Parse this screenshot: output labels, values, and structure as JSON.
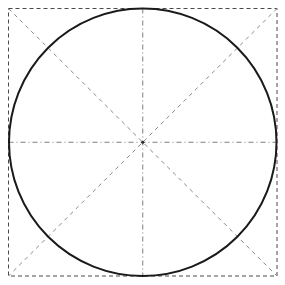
{
  "figure": {
    "type": "geometric-construction",
    "width": 285,
    "height": 285,
    "background_color": "#ffffff"
  },
  "geometry": {
    "square": {
      "name": "bounding-square",
      "left": 8.5,
      "top": 8.5,
      "right": 277.0,
      "bottom": 276.0,
      "width": 268.5,
      "height": 267.5,
      "stroke_color": "#4a4a4a",
      "stroke_width": 1,
      "dash_pattern": "4,3",
      "style": "dashed"
    },
    "circle": {
      "name": "inscribed-circle",
      "center_x": 142.75,
      "center_y": 142.25,
      "radius": 133.75,
      "stroke_color": "#1a1a1a",
      "stroke_width": 2,
      "fill": "none",
      "style": "solid"
    },
    "center_point": {
      "name": "center-point",
      "x": 142.75,
      "y": 142.25,
      "color": "#2a2a2a"
    },
    "radial_lines": [
      {
        "name": "horizontal-axis",
        "angle_deg": 0,
        "x1": 8.5,
        "y1": 142.25,
        "x2": 277.0,
        "y2": 142.25,
        "stroke_color": "#7d7d7d",
        "stroke_width": 1,
        "dash_pattern": "5,3,1,3",
        "style": "dash-dot"
      },
      {
        "name": "vertical-axis",
        "angle_deg": 90,
        "x1": 142.75,
        "y1": 8.5,
        "x2": 142.75,
        "y2": 276.0,
        "stroke_color": "#7d7d7d",
        "stroke_width": 1,
        "dash_pattern": "5,3,1,3",
        "style": "dash-dot"
      },
      {
        "name": "diagonal-nw-se",
        "angle_deg": -45,
        "x1": 8.5,
        "y1": 8.5,
        "x2": 277.0,
        "y2": 276.0,
        "stroke_color": "#8a8a8a",
        "stroke_width": 1,
        "dash_pattern": "4,4",
        "style": "dashed"
      },
      {
        "name": "diagonal-ne-sw",
        "angle_deg": 45,
        "x1": 277.0,
        "y1": 8.5,
        "x2": 8.5,
        "y2": 276.0,
        "stroke_color": "#8a8a8a",
        "stroke_width": 1,
        "dash_pattern": "4,4",
        "style": "dashed"
      }
    ],
    "tangent_points": [
      {
        "name": "tangent-top",
        "x": 142.75,
        "y": 8.5
      },
      {
        "name": "tangent-right",
        "x": 277.0,
        "y": 142.25
      },
      {
        "name": "tangent-bottom",
        "x": 142.75,
        "y": 276.0
      },
      {
        "name": "tangent-left",
        "x": 8.5,
        "y": 142.25
      }
    ],
    "sector_count": 8,
    "sector_angle_deg": 45
  }
}
